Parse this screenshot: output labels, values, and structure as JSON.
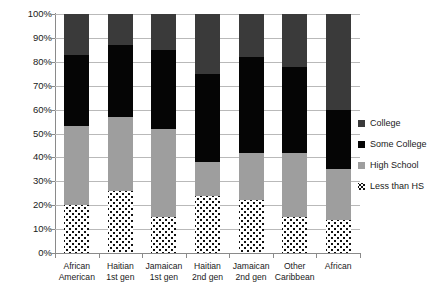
{
  "chart_data": {
    "type": "bar",
    "subtype": "stacked-percentage",
    "title": "",
    "subtitle": "",
    "xlabel": "",
    "ylabel": "",
    "ylim": [
      0,
      100
    ],
    "y_unit": "%",
    "grid": true,
    "legend_position": "right",
    "categories": [
      "African American",
      "Haitian 1st gen",
      "Jamaican 1st gen",
      "Haitian 2nd gen",
      "Jamaican 2nd gen",
      "Other Caribbean",
      "African"
    ],
    "category_lines": [
      [
        "African",
        "American"
      ],
      [
        "Haitian",
        "1st gen"
      ],
      [
        "Jamaican",
        "1st gen"
      ],
      [
        "Haitian",
        "2nd gen"
      ],
      [
        "Jamaican",
        "2nd gen"
      ],
      [
        "Other",
        "Caribbean"
      ],
      [
        "African",
        ""
      ]
    ],
    "y_ticks": [
      "0%",
      "10%",
      "20%",
      "30%",
      "40%",
      "50%",
      "60%",
      "70%",
      "80%",
      "90%",
      "100%"
    ],
    "y_tick_values": [
      0,
      10,
      20,
      30,
      40,
      50,
      60,
      70,
      80,
      90,
      100
    ],
    "stack_order_bottom_to_top": [
      "Less than HS",
      "High School",
      "Some College",
      "College"
    ],
    "series": [
      {
        "name": "Less than HS",
        "color": "#ffffff",
        "pattern": "dotted",
        "values": [
          20,
          26,
          15,
          24,
          22,
          15,
          14
        ]
      },
      {
        "name": "High School",
        "color": "#9e9e9e",
        "values": [
          33,
          31,
          37,
          14,
          20,
          27,
          21
        ]
      },
      {
        "name": "Some College",
        "color": "#050505",
        "values": [
          30,
          30,
          33,
          37,
          40,
          36,
          25
        ]
      },
      {
        "name": "College",
        "color": "#3a3a3a",
        "values": [
          17,
          13,
          15,
          25,
          18,
          22,
          40
        ]
      }
    ],
    "cumulative_tops": {
      "Less than HS": [
        20,
        26,
        15,
        24,
        22,
        15,
        14
      ],
      "High School": [
        53,
        57,
        52,
        38,
        42,
        42,
        35
      ],
      "Some College": [
        83,
        87,
        85,
        75,
        82,
        78,
        60
      ],
      "College": [
        100,
        100,
        100,
        100,
        100,
        100,
        100
      ]
    }
  },
  "legend": {
    "items": [
      {
        "label": "College",
        "swatch": "college"
      },
      {
        "label": "Some College",
        "swatch": "some-college"
      },
      {
        "label": "High School",
        "swatch": "high-school"
      },
      {
        "label": "Less than HS",
        "swatch": "less-than-hs"
      }
    ]
  },
  "colors": {
    "college": "#3a3a3a",
    "some_college": "#050505",
    "high_school": "#9e9e9e",
    "less_than_hs": "#ffffff",
    "gridline": "#b9b9b9",
    "axis": "#8a8a8a",
    "text": "#1a1a1a",
    "background": "#ffffff"
  }
}
